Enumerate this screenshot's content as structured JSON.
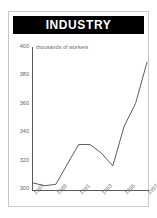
{
  "figure": {
    "title": "INDUSTRY",
    "accent_color": "#000000",
    "title_text_color": "#ffffff",
    "frame_color": "#c9c9c9",
    "axis_color": "#5a5a5a",
    "line_color": "#4a4a4a",
    "background": "#ffffff"
  },
  "chart_data": {
    "type": "line",
    "title": "INDUSTRY",
    "subtitle": "thousands of workers",
    "xlabel": "",
    "ylabel": "thousands of workers",
    "grid": false,
    "legend": false,
    "ylim": [
      300,
      400
    ],
    "yticks": [
      300,
      320,
      340,
      360,
      380,
      400
    ],
    "ytick_labels": [
      "300",
      "320",
      "340",
      "360",
      "380",
      "400"
    ],
    "xticks": [
      1987,
      1989,
      1991,
      1993,
      1995,
      1997
    ],
    "xtick_labels": [
      "1987",
      "1989",
      "1991",
      "1993",
      "1995",
      "1997"
    ],
    "x": [
      1987,
      1988,
      1989,
      1990,
      1991,
      1992,
      1993,
      1994,
      1995,
      1996,
      1997
    ],
    "values": [
      305,
      303,
      304,
      318,
      332,
      332,
      326,
      317,
      345,
      361,
      390
    ],
    "series": [
      {
        "name": "thousands of workers",
        "values": [
          305,
          303,
          304,
          318,
          332,
          332,
          326,
          317,
          345,
          361,
          390
        ]
      }
    ]
  }
}
